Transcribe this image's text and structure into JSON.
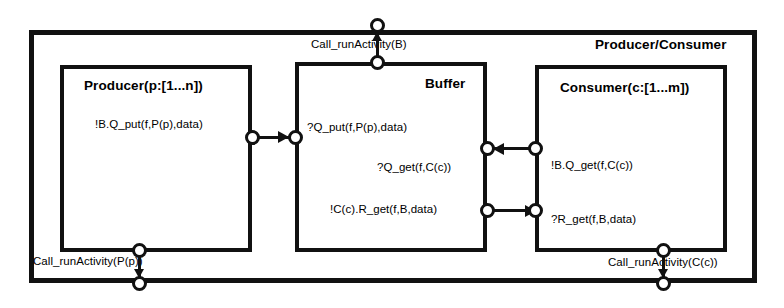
{
  "diagram": {
    "type": "uml-composite-structure",
    "frame": {
      "title": "Producer/Consumer"
    },
    "parts": [
      {
        "id": "producer",
        "title": "Producer(p:[1...n])",
        "signals": [
          {
            "id": "producer-put",
            "text": "!B.Q_put(f,P(p),data)"
          }
        ]
      },
      {
        "id": "buffer",
        "title": "Buffer",
        "signals": [
          {
            "id": "buffer-put",
            "text": "?Q_put(f,P(p),data)"
          },
          {
            "id": "buffer-get",
            "text": "?Q_get(f,C(c))"
          },
          {
            "id": "buffer-reply",
            "text": "!C(c).R_get(f,B,data)"
          }
        ]
      },
      {
        "id": "consumer",
        "title": "Consumer(c:[1...m])",
        "signals": [
          {
            "id": "consumer-get",
            "text": "!B.Q_get(f,C(c))"
          },
          {
            "id": "consumer-reply",
            "text": "?R_get(f,B,data)"
          }
        ]
      }
    ],
    "delegations": [
      {
        "id": "call-buffer",
        "text": "Call_runActivity(B)",
        "direction": "up"
      },
      {
        "id": "call-producer",
        "text": "Call_runActivity(P(p))",
        "direction": "down"
      },
      {
        "id": "call-consumer",
        "text": "Call_runActivity(C(c))",
        "direction": "down"
      }
    ]
  },
  "colors": {
    "line": "#111111",
    "background": "#ffffff",
    "text": "#000000"
  }
}
